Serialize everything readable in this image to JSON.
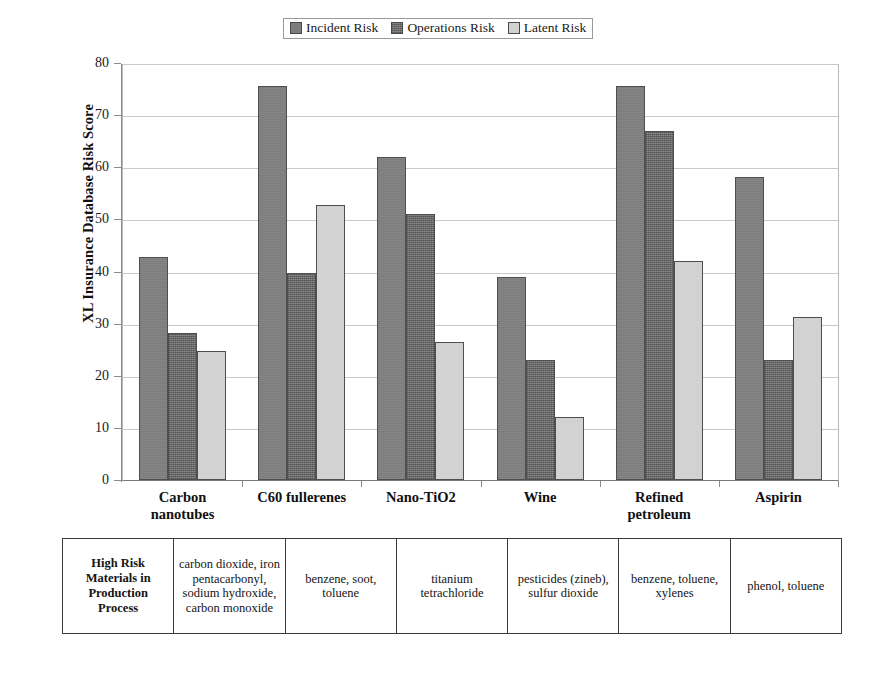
{
  "legend": {
    "items": [
      {
        "label": "Incident Risk",
        "key": "incident",
        "color": "#7d7d7d"
      },
      {
        "label": "Operations Risk",
        "key": "operations",
        "color": "#8b8b8b"
      },
      {
        "label": "Latent Risk",
        "key": "latent",
        "color": "#d2d2d2"
      }
    ]
  },
  "axis": {
    "y_title": "XL Insurance Database Risk Score",
    "y_ticks": [
      "0",
      "10",
      "20",
      "30",
      "40",
      "50",
      "60",
      "70",
      "80"
    ]
  },
  "table": {
    "row_header": "High Risk Materials in Production Process",
    "cells": [
      "carbon dioxide, iron pentacarbonyl, sodium hydroxide, carbon monoxide",
      "benzene, soot, toluene",
      "titanium tetrachloride",
      "pesticides (zineb), sulfur dioxide",
      "benzene, toluene, xylenes",
      "phenol, toluene"
    ]
  },
  "chart_data": {
    "type": "bar",
    "title": "",
    "xlabel": "",
    "ylabel": "XL Insurance Database Risk Score",
    "ylim": [
      0,
      80
    ],
    "ytick_step": 10,
    "grid": true,
    "legend_position": "top-center",
    "categories": [
      "Carbon nanotubes",
      "C60 fullerenes",
      "Nano-TiO2",
      "Wine",
      "Refined petroleum",
      "Aspirin"
    ],
    "category_lines": [
      [
        "Carbon",
        "nanotubes"
      ],
      [
        "C60 fullerenes"
      ],
      [
        "Nano-TiO2"
      ],
      [
        "Wine"
      ],
      [
        "Refined",
        "petroleum"
      ],
      [
        "Aspirin"
      ]
    ],
    "series": [
      {
        "name": "Incident Risk",
        "color": "#7d7d7d",
        "values": [
          43.0,
          76.0,
          62.3,
          39.2,
          76.0,
          58.4
        ]
      },
      {
        "name": "Operations Risk",
        "color": "#8b8b8b",
        "values": [
          28.4,
          40.0,
          51.2,
          23.2,
          67.2,
          23.1
        ]
      },
      {
        "name": "Latent Risk",
        "color": "#d2d2d2",
        "values": [
          24.9,
          53.1,
          26.6,
          12.1,
          42.2,
          31.4
        ]
      }
    ]
  }
}
